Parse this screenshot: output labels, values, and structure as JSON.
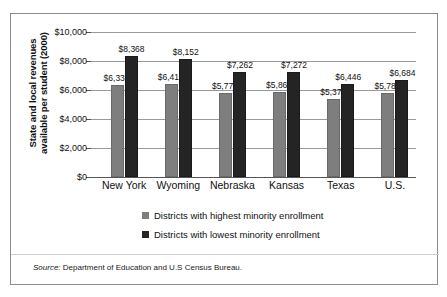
{
  "chart_data": {
    "type": "bar",
    "title": "",
    "subtitle": "",
    "xlabel": "",
    "ylabel": "State and local revenues available per student (2000)",
    "ylabel_line1": "State and local revenues",
    "ylabel_line2": "available per student (2000)",
    "ylim": [
      0,
      10000
    ],
    "ytick_values": [
      0,
      2000,
      4000,
      6000,
      8000,
      10000
    ],
    "ytick_labels": [
      "$0",
      "$2,000",
      "$4,000",
      "$6,000",
      "$8,000",
      "$10,000"
    ],
    "grid": true,
    "legend_position": "bottom",
    "categories": [
      "New York",
      "Wyoming",
      "Nebraska",
      "Kansas",
      "Texas",
      "U.S."
    ],
    "series": [
      {
        "name": "Districts with highest minority enrollment",
        "color": "#7e7e7e",
        "values": [
          6335,
          6418,
          5777,
          5868,
          5378,
          5782
        ],
        "labels": [
          "$6,335",
          "$6,418",
          "$5,777",
          "$5,868",
          "$5,378",
          "$5,782"
        ]
      },
      {
        "name": "Districts with lowest minority enrollment",
        "color": "#242424",
        "values": [
          8368,
          8152,
          7262,
          7272,
          6446,
          6684
        ],
        "labels": [
          "$8,368",
          "$8,152",
          "$7,262",
          "$7,272",
          "$6,446",
          "$6,684"
        ]
      }
    ],
    "source": {
      "prefix": "Source:",
      "text": "Department of Education and U.S Census Bureau.",
      "full": "Source: Department of Education and U.S Census Bureau."
    }
  }
}
